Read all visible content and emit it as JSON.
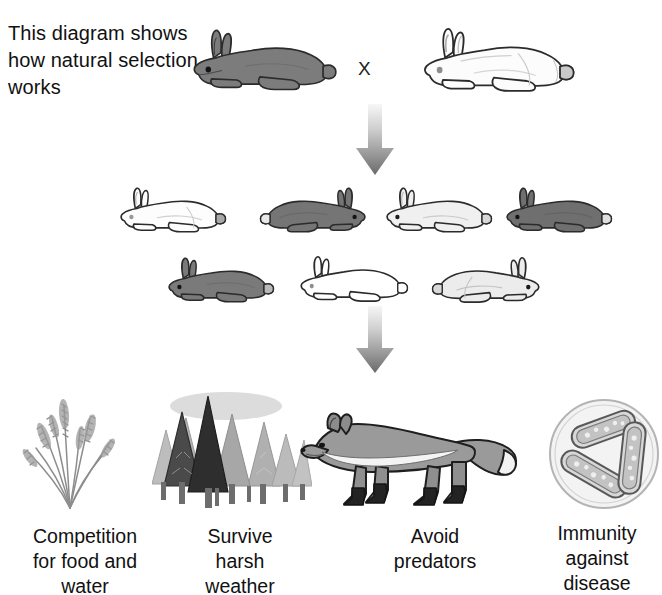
{
  "diagram": {
    "caption": "This diagram shows how natural selection works",
    "caption_lines": [
      "This diagram shows",
      "how natural",
      "selection works"
    ],
    "cross_symbol": "X",
    "arrow_symbol": "down-arrow"
  },
  "parents": {
    "row_name": "parent-generation",
    "rabbits": [
      {
        "name": "parent-rabbit-dark",
        "coat": "dark gray",
        "facing": "left",
        "color": "#7c7c7c"
      },
      {
        "name": "parent-rabbit-white",
        "coat": "white",
        "facing": "left",
        "color": "#fbfbfb"
      }
    ]
  },
  "offspring_row1": {
    "row_name": "offspring-row-1",
    "rabbits": [
      {
        "name": "offspring-rabbit-white",
        "coat": "white",
        "facing": "left",
        "color": "#fcfcfc"
      },
      {
        "name": "offspring-rabbit-dark",
        "coat": "dark gray",
        "facing": "right",
        "color": "#757575"
      },
      {
        "name": "offspring-rabbit-light",
        "coat": "light gray",
        "facing": "left",
        "color": "#efefef"
      },
      {
        "name": "offspring-rabbit-dark-2",
        "coat": "dark gray",
        "facing": "left",
        "color": "#6f6f6f"
      }
    ]
  },
  "offspring_row2": {
    "row_name": "offspring-row-2",
    "rabbits": [
      {
        "name": "offspring-rabbit-dark-3",
        "coat": "dark gray",
        "facing": "left",
        "color": "#7a7a7a"
      },
      {
        "name": "offspring-rabbit-spotted",
        "coat": "white with black spots",
        "facing": "left",
        "color": "#ffffff"
      },
      {
        "name": "offspring-rabbit-pale",
        "coat": "very light gray",
        "facing": "right",
        "color": "#e9e9e9"
      }
    ]
  },
  "selection_pressures": [
    {
      "icon": "grass-plant-icon",
      "label": "Competition for food and water",
      "lines": [
        "Competition",
        "for food and",
        "water"
      ]
    },
    {
      "icon": "pine-forest-icon",
      "label": "Survive harsh weather",
      "lines": [
        "Survive",
        "harsh",
        "weather"
      ]
    },
    {
      "icon": "fox-icon",
      "label": "Avoid predators",
      "lines": [
        "Avoid",
        "predators"
      ]
    },
    {
      "icon": "bacteria-icon",
      "label": "Immunity against disease",
      "lines": [
        "Immunity",
        "against",
        "disease"
      ]
    }
  ],
  "colors": {
    "background": "#ffffff",
    "text": "#111111",
    "outline": "#2b2b2b",
    "dark_fur": "#787878",
    "light_fur": "#efefef",
    "white_fur": "#fcfcfc",
    "arrow_top": "#f2f2f2",
    "arrow_bottom": "#6e6e6e",
    "fox_body": "#9a9a9a",
    "fox_legs": "#262626",
    "plant": "#8a8a8a",
    "forest_dark": "#3a3a3a",
    "forest_light": "#b6b6b6",
    "bacteria": "#cfcfcf"
  }
}
